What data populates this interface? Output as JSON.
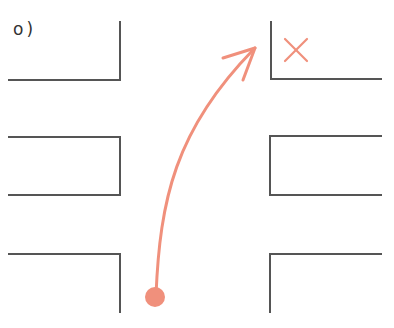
{
  "figure": {
    "label": "o)",
    "colors": {
      "wall": "#555555",
      "path": "#f0907c",
      "label": "#333333"
    },
    "blocks": [
      {
        "id": "top-left",
        "side": "left",
        "shape": "corner-open-top"
      },
      {
        "id": "top-right",
        "side": "right",
        "shape": "corner-open-top"
      },
      {
        "id": "middle-left",
        "side": "left",
        "shape": "bracket"
      },
      {
        "id": "middle-right",
        "side": "right",
        "shape": "bracket"
      },
      {
        "id": "bottom-left",
        "side": "left",
        "shape": "corner-open-bottom"
      },
      {
        "id": "bottom-right",
        "side": "right",
        "shape": "corner-open-bottom"
      }
    ],
    "start_marker": "filled-circle",
    "end_marker": "x-mark",
    "path": "curved-arrow"
  }
}
